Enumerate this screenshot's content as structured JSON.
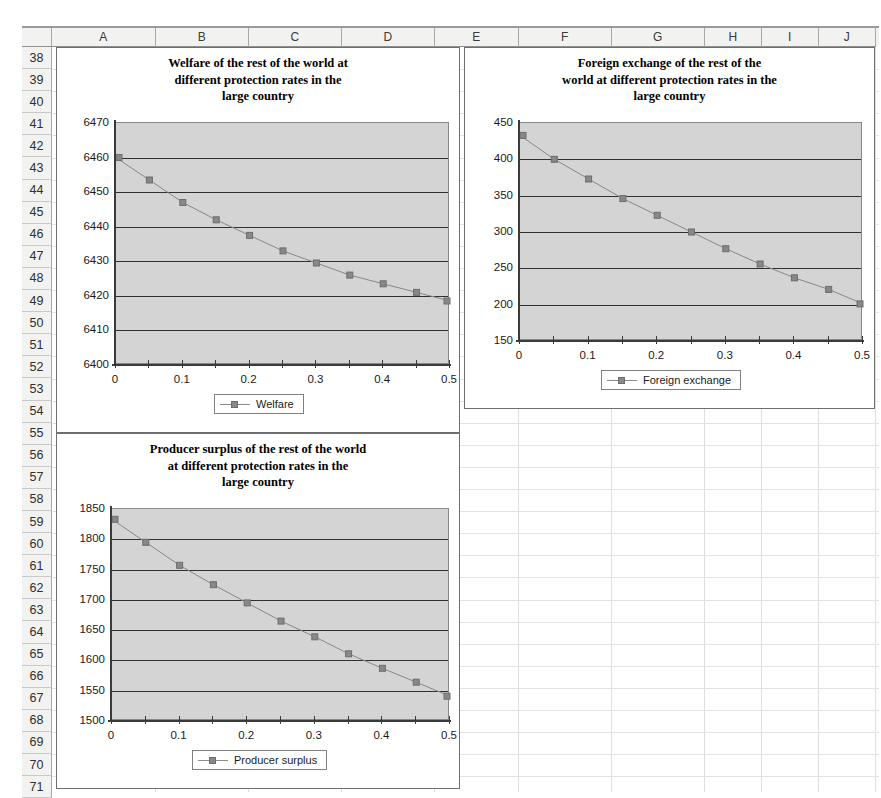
{
  "spreadsheet": {
    "columns": [
      {
        "label": "A",
        "width": 104
      },
      {
        "label": "B",
        "width": 93
      },
      {
        "label": "C",
        "width": 93
      },
      {
        "label": "D",
        "width": 93
      },
      {
        "label": "E",
        "width": 84
      },
      {
        "label": "F",
        "width": 93
      },
      {
        "label": "G",
        "width": 93
      },
      {
        "label": "H",
        "width": 57
      },
      {
        "label": "I",
        "width": 57
      },
      {
        "label": "J",
        "width": 57
      }
    ],
    "rows": [
      "38",
      "39",
      "40",
      "41",
      "42",
      "43",
      "44",
      "45",
      "46",
      "47",
      "48",
      "49",
      "50",
      "51",
      "52",
      "53",
      "54",
      "55",
      "56",
      "57",
      "58",
      "59",
      "60",
      "61",
      "62",
      "63",
      "64",
      "65",
      "66",
      "67",
      "68",
      "69",
      "70",
      "71"
    ]
  },
  "chart_data": [
    {
      "type": "line",
      "name": "welfare-chart",
      "title": "Welfare of the rest of the world at different protection rates in the large country",
      "title_lines": [
        "Welfare of the rest of the world at",
        "different protection rates in the",
        "large country"
      ],
      "xlabel": "",
      "ylabel": "",
      "grid": true,
      "legend_position": "bottom",
      "legend_entries": [
        "Welfare"
      ],
      "series_name": "Welfare",
      "series_color": "#888888",
      "x": [
        0,
        0.05,
        0.1,
        0.15,
        0.2,
        0.25,
        0.3,
        0.35,
        0.4,
        0.45,
        0.5
      ],
      "values": [
        6460,
        6453.5,
        6447,
        6442,
        6437.5,
        6433,
        6429.5,
        6426,
        6423.5,
        6421,
        6418.5
      ],
      "xlim": [
        0,
        0.5
      ],
      "ylim": [
        6400,
        6470
      ],
      "ytick_labels": [
        "6470",
        "6460",
        "6450",
        "6440",
        "6430",
        "6420",
        "6410",
        "6400"
      ],
      "ytick_values": [
        6470,
        6460,
        6450,
        6440,
        6430,
        6420,
        6410,
        6400
      ],
      "xtick_labels": [
        "0",
        "0.1",
        "0.2",
        "0.3",
        "0.4",
        "0.5"
      ],
      "xtick_values": [
        0,
        0.1,
        0.2,
        0.3,
        0.4,
        0.5
      ]
    },
    {
      "type": "line",
      "name": "foreign-exchange-chart",
      "title": "Foreign exchange of the rest of the world at different protection rates in the large country",
      "title_lines": [
        "Foreign exchange of the rest of the",
        "world at different protection rates in the",
        "large country"
      ],
      "xlabel": "",
      "ylabel": "",
      "grid": true,
      "legend_position": "bottom",
      "legend_entries": [
        "Foreign exchange"
      ],
      "series_name": "Foreign exchange",
      "series_color": "#888888",
      "x": [
        0,
        0.05,
        0.1,
        0.15,
        0.2,
        0.25,
        0.3,
        0.35,
        0.4,
        0.45,
        0.5
      ],
      "values": [
        433,
        400,
        373,
        346,
        323,
        300,
        277,
        256,
        237,
        221,
        201
      ],
      "xlim": [
        0,
        0.5
      ],
      "ylim": [
        150,
        450
      ],
      "ytick_labels": [
        "450",
        "400",
        "350",
        "300",
        "250",
        "200",
        "150"
      ],
      "ytick_values": [
        450,
        400,
        350,
        300,
        250,
        200,
        150
      ],
      "xtick_labels": [
        "0",
        "0.1",
        "0.2",
        "0.3",
        "0.4",
        "0.5"
      ],
      "xtick_values": [
        0,
        0.1,
        0.2,
        0.3,
        0.4,
        0.5
      ]
    },
    {
      "type": "line",
      "name": "producer-surplus-chart",
      "title": "Producer surplus of the rest of the world at different protection rates in the large country",
      "title_lines": [
        "Producer surplus of the rest of the world",
        "at different protection rates in the",
        "large country"
      ],
      "xlabel": "",
      "ylabel": "",
      "grid": true,
      "legend_position": "bottom",
      "legend_entries": [
        "Producer surplus"
      ],
      "series_name": "Producer surplus",
      "series_color": "#888888",
      "x": [
        0,
        0.05,
        0.1,
        0.15,
        0.2,
        0.25,
        0.3,
        0.35,
        0.4,
        0.45,
        0.5
      ],
      "values": [
        1833,
        1795,
        1757,
        1725,
        1695,
        1665,
        1639,
        1611,
        1587,
        1564,
        1541
      ],
      "xlim": [
        0,
        0.5
      ],
      "ylim": [
        1500,
        1850
      ],
      "ytick_labels": [
        "1850",
        "1800",
        "1750",
        "1700",
        "1650",
        "1600",
        "1550",
        "1500"
      ],
      "ytick_values": [
        1850,
        1800,
        1750,
        1700,
        1650,
        1600,
        1550,
        1500
      ],
      "xtick_labels": [
        "0",
        "0.1",
        "0.2",
        "0.3",
        "0.4",
        "0.5"
      ],
      "xtick_values": [
        0,
        0.1,
        0.2,
        0.3,
        0.4,
        0.5
      ]
    }
  ]
}
